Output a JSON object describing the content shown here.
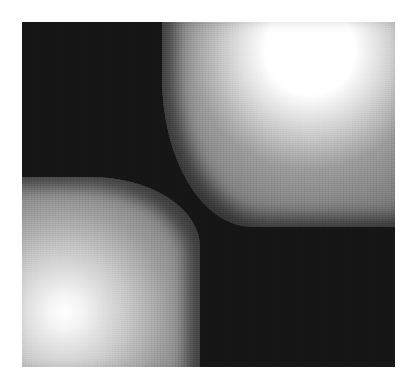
{
  "image": {
    "description": "Grayscale intensity field with two bright circular sources",
    "colors": {
      "background": "#ffffff",
      "dark_region": "#151515",
      "peak": "#ffffff",
      "mid_gray": "#8a8a8a"
    },
    "sources": [
      {
        "name": "upper-right source",
        "center_px": [
          310,
          50
        ]
      },
      {
        "name": "lower-left source",
        "center_px": [
          65,
          312
        ]
      }
    ]
  }
}
